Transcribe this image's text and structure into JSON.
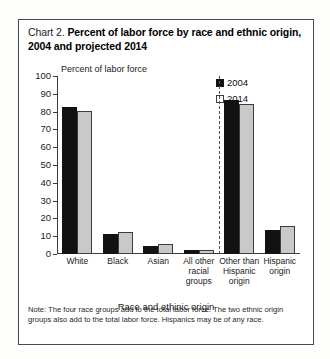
{
  "figure": {
    "label": "Chart 2.",
    "title": "Percent of labor force by race and ethnic origin, 2004 and projected 2014",
    "note": "Note: The four race groups add to the total labor force. The two ethnic origin groups also add to the total labor force. Hispanics may be of any race."
  },
  "legend": {
    "items": [
      {
        "label": "2004",
        "color": "#121212"
      },
      {
        "label": "2014",
        "color": "#c9c9c9"
      }
    ]
  },
  "axis": {
    "y_caption": "Percent of labor force",
    "x_title": "Race and ethinic origin",
    "y_ticks": [
      "100",
      "90",
      "80",
      "70",
      "60",
      "50",
      "40",
      "30",
      "20",
      "10",
      "0"
    ]
  },
  "chart_data": {
    "type": "bar",
    "title": "Chart 2. Percent of labor force by race and ethnic origin, 2004 and projected 2014",
    "xlabel": "Race and ethinic origin",
    "ylabel": "Percent of labor force",
    "ylim": [
      0,
      100
    ],
    "ytick_step": 10,
    "grid": false,
    "legend_position": "top-right",
    "categories": [
      "White",
      "Black",
      "Asian",
      "All other racial groups",
      "Other than Hispanic origin",
      "Hispanic origin"
    ],
    "category_display": [
      "White",
      "Black",
      "Asian",
      "All other\nracial\ngroups",
      "Other than\nHispanic\norigin",
      "Hispanic\norigin"
    ],
    "series": [
      {
        "name": "2004",
        "color": "#121212",
        "values": [
          82.5,
          11.0,
          4.3,
          2.0,
          86.5,
          13.5
        ]
      },
      {
        "name": "2014",
        "color": "#c9c9c9",
        "values": [
          80.5,
          12.5,
          5.5,
          2.3,
          84.5,
          16.0
        ]
      }
    ],
    "group_divider_after_category": "All other racial groups",
    "annotations": [
      "Note: The four race groups add to the total labor force. The two ethnic origin groups also add to the total labor force. Hispanics may be of any race."
    ]
  }
}
